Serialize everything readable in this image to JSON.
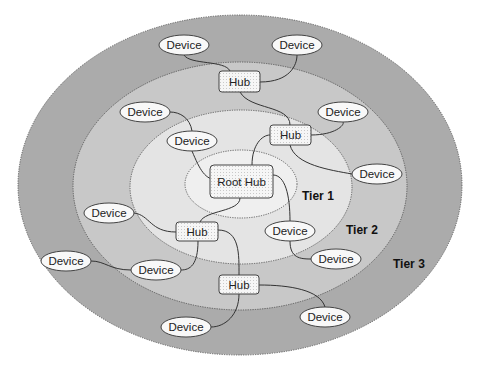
{
  "diagram": {
    "colors": {
      "tier3_fill": "#ababab",
      "tier2_fill": "#c8c8c8",
      "tier1_fill": "#e4e4e4",
      "root_fill": "#efefef",
      "node_fill": "#f4f4f4",
      "stroke": "#333333"
    },
    "tiers": [
      {
        "id": "root",
        "cx": 241,
        "cy": 184,
        "rx": 56,
        "ry": 34
      },
      {
        "id": "tier1",
        "label": "Tier 1",
        "cx": 241,
        "cy": 187,
        "rx": 111,
        "ry": 77,
        "label_x": 302,
        "label_y": 200
      },
      {
        "id": "tier2",
        "label": "Tier 2",
        "cx": 240,
        "cy": 186,
        "rx": 167,
        "ry": 124,
        "label_x": 346,
        "label_y": 234
      },
      {
        "id": "tier3",
        "label": "Tier 3",
        "cx": 240,
        "cy": 185,
        "rx": 222,
        "ry": 170,
        "label_x": 393,
        "label_y": 268
      }
    ],
    "root_hub": {
      "label": "Root Hub",
      "x": 210,
      "y": 165,
      "w": 63,
      "h": 33
    },
    "hubs": [
      {
        "label": "Hub",
        "x": 219,
        "y": 71,
        "w": 41,
        "h": 21
      },
      {
        "label": "Hub",
        "x": 270,
        "y": 125,
        "w": 41,
        "h": 20
      },
      {
        "label": "Hub",
        "x": 176,
        "y": 222,
        "w": 42,
        "h": 19
      },
      {
        "label": "Hub",
        "x": 219,
        "y": 275,
        "w": 40,
        "h": 19
      }
    ],
    "devices": [
      {
        "label": "Device",
        "cx": 184,
        "cy": 45
      },
      {
        "label": "Device",
        "cx": 297,
        "cy": 45
      },
      {
        "label": "Device",
        "cx": 145,
        "cy": 112
      },
      {
        "label": "Device",
        "cx": 343,
        "cy": 112
      },
      {
        "label": "Device",
        "cx": 192,
        "cy": 141
      },
      {
        "label": "Device",
        "cx": 377,
        "cy": 174
      },
      {
        "label": "Device",
        "cx": 109,
        "cy": 213
      },
      {
        "label": "Device",
        "cx": 290,
        "cy": 231
      },
      {
        "label": "Device",
        "cx": 336,
        "cy": 259
      },
      {
        "label": "Device",
        "cx": 66,
        "cy": 261
      },
      {
        "label": "Device",
        "cx": 156,
        "cy": 270
      },
      {
        "label": "Device",
        "cx": 325,
        "cy": 317
      },
      {
        "label": "Device",
        "cx": 186,
        "cy": 327
      }
    ],
    "connections": [
      "M 252 165 C 252 145, 262 135, 270 135",
      "M 218 180 C 205 180, 200 170, 192 151",
      "M 273 175 C 285 175, 290 195, 290 221",
      "M 240 198 C 240 212, 205 210, 200 222",
      "M 290 125 C 290 105, 250 110, 240 92",
      "M 311 135 C 335 135, 345 125, 343 122",
      "M 290 145 C 295 165, 330 170, 352 174",
      "M 230 71 C 225 60, 190 65, 184 55",
      "M 260 82 C 290 82, 297 65, 297 55",
      "M 192 131 C 190 118, 180 112, 170 112",
      "M 176 232 C 150 232, 150 215, 134 213",
      "M 198 241 C 198 265, 190 270, 181 270",
      "M 218 230 C 240 230, 239 255, 239 275",
      "M 131 270 C 110 270, 105 261, 91 261",
      "M 290 241 C 290 258, 300 259, 311 259",
      "M 259 285 C 290 285, 320 290, 325 307",
      "M 239 294 C 239 315, 225 327, 211 327"
    ]
  }
}
